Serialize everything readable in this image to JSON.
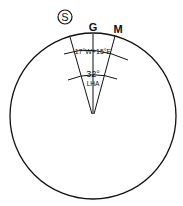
{
  "diagram": {
    "hemisphere_label": "S",
    "meridian_labels": {
      "greenwich": "G",
      "body": "M"
    },
    "longitude_label": "17°W+15°E",
    "lha_value": "32°",
    "lha_label": "LHA",
    "colors": {
      "line": "#111111",
      "background": "#ffffff"
    }
  }
}
